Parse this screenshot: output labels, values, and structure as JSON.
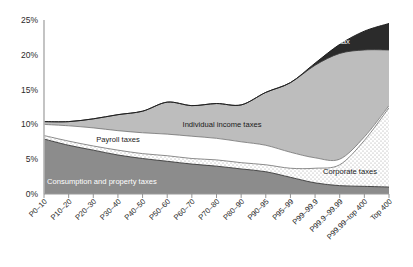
{
  "chart_data": {
    "type": "area",
    "stacked": true,
    "title": "",
    "subtitle": "",
    "xlabel": "",
    "ylabel": "",
    "ylim": [
      0,
      25
    ],
    "yticks": [
      0,
      5,
      10,
      15,
      20,
      25
    ],
    "ytick_labels": [
      "0%",
      "5%",
      "10%",
      "15%",
      "20%",
      "25%"
    ],
    "grid": false,
    "legend_position": "inline-annotations",
    "categories": [
      "P0–10",
      "P10–20",
      "P20–30",
      "P30–40",
      "P40–50",
      "P50–60",
      "P60–70",
      "P70–80",
      "P80–90",
      "P90–95",
      "P95–99",
      "P99–99.9",
      "P99.9–99.99",
      "P99.99–top 400",
      "Top 400"
    ],
    "series": [
      {
        "name": "Consumption and property taxes",
        "color": "#8c8c8c",
        "pattern": "solid",
        "values": [
          7.9,
          7.0,
          6.3,
          5.6,
          5.1,
          4.7,
          4.3,
          4.0,
          3.6,
          3.2,
          2.4,
          1.6,
          1.2,
          1.1,
          1.0
        ]
      },
      {
        "name": "Corporate taxes",
        "color": "#ffffff",
        "pattern": "dotted-stipple",
        "values": [
          0.5,
          0.6,
          0.6,
          0.7,
          0.7,
          0.8,
          0.8,
          0.9,
          0.9,
          1.0,
          1.3,
          2.1,
          3.0,
          6.6,
          11.4
        ]
      },
      {
        "name": "Payroll taxes",
        "color": "#ffffff",
        "pattern": "solid",
        "values": [
          1.6,
          2.2,
          2.6,
          2.8,
          3.0,
          3.1,
          3.2,
          3.1,
          3.0,
          2.8,
          2.3,
          1.5,
          0.8,
          0.5,
          0.3
        ]
      },
      {
        "name": "Individual income taxes",
        "color": "#bdbdbd",
        "pattern": "solid",
        "values": [
          0.4,
          0.6,
          1.3,
          2.3,
          3.1,
          4.6,
          4.4,
          5.0,
          5.3,
          7.6,
          10.0,
          13.3,
          15.2,
          12.5,
          8.0
        ]
      },
      {
        "name": "Estate tax",
        "color": "#2b2b2b",
        "pattern": "solid",
        "values": [
          0.0,
          0.0,
          0.0,
          0.0,
          0.0,
          0.0,
          0.0,
          0.0,
          0.0,
          0.0,
          0.0,
          0.3,
          1.3,
          2.7,
          3.8
        ]
      }
    ],
    "totals": [
      10.4,
      10.4,
      10.8,
      11.4,
      11.9,
      13.2,
      12.7,
      13.0,
      12.8,
      14.6,
      16.0,
      18.8,
      21.5,
      23.4,
      24.5
    ],
    "annotations": [
      {
        "text": "Estate tax",
        "series": "Estate tax",
        "style": "light"
      },
      {
        "text": "Individual income taxes",
        "series": "Individual income taxes",
        "style": "dark"
      },
      {
        "text": "Payroll taxes",
        "series": "Payroll taxes",
        "style": "dark"
      },
      {
        "text": "Consumption and property taxes",
        "series": "Consumption and property taxes",
        "style": "light"
      },
      {
        "text": "Corporate taxes",
        "series": "Corporate taxes",
        "style": "dark"
      }
    ]
  },
  "axis": {
    "y_labels": [
      "25%",
      "20%",
      "15%",
      "10%",
      "5%",
      "0%"
    ],
    "x_labels": [
      "P0–10",
      "P10–20",
      "P20–30",
      "P30–40",
      "P40–50",
      "P50–60",
      "P60–70",
      "P70–80",
      "P80–90",
      "P90–95",
      "P95–99",
      "P99–99.9",
      "P99.9–99.99",
      "P99.99–top 400",
      "Top 400"
    ]
  },
  "labels": {
    "estate_tax": "Estate tax",
    "individual_income_taxes": "Individual income taxes",
    "payroll_taxes": "Payroll taxes",
    "consumption_and_property_taxes": "Consumption and property taxes",
    "corporate_taxes": "Corporate taxes"
  },
  "colors": {
    "consumption": "#8c8c8c",
    "corporate": "#ffffff",
    "payroll": "#ffffff",
    "income": "#bdbdbd",
    "estate": "#2b2b2b",
    "axis": "#b0b0b0",
    "stroke": "#3a3a3a"
  }
}
